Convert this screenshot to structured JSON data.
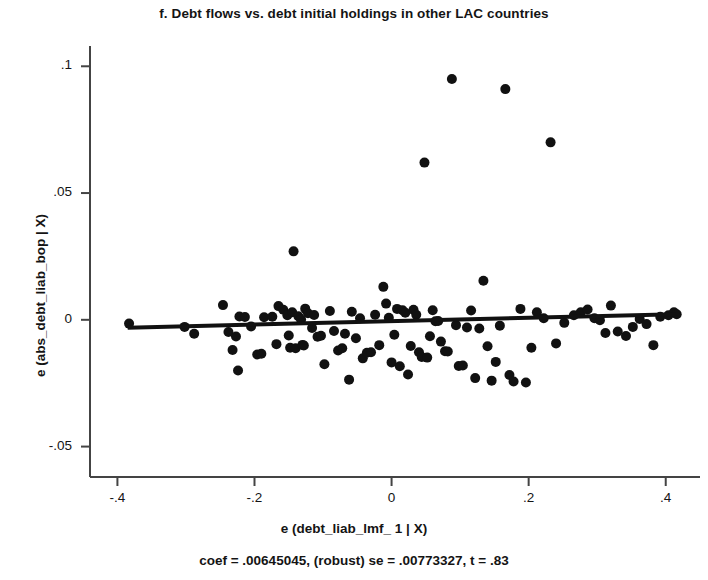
{
  "figure": {
    "title": "f.  Debt flows vs. debt initial holdings in other LAC countries",
    "xlabel": "e (debt_liab_lmf_ 1 | X)",
    "ylabel": "e (abs_debt_liab_bop | X)",
    "caption": "coef = .00645045, (robust) se = .00773327, t = .83",
    "marker_color": "#111111",
    "line_color": "#111111",
    "axis_color": "#444444",
    "background": "#ffffff"
  },
  "axes": {
    "x_ticks": [
      "-.4",
      "-.2",
      "0",
      ".2",
      ".4"
    ],
    "x_tick_values": [
      -0.4,
      -0.2,
      0,
      0.2,
      0.4
    ],
    "y_ticks": [
      ".1",
      ".05",
      "0",
      "-.05"
    ],
    "y_tick_values": [
      0.1,
      0.05,
      0,
      -0.05
    ]
  },
  "chart_data": {
    "type": "scatter",
    "title": "f.  Debt flows vs. debt initial holdings in other LAC countries",
    "xlabel": "e (debt_liab_lmf_ 1 | X)",
    "ylabel": "e (abs_debt_liab_bop | X)",
    "annotation": "coef = .00645045, (robust) se = .00773327, t = .83",
    "xlim": [
      -0.44,
      0.45
    ],
    "ylim": [
      -0.062,
      0.108
    ],
    "xticks": [
      -0.4,
      -0.2,
      0,
      0.2,
      0.4
    ],
    "yticks": [
      -0.05,
      0,
      0.05,
      0.1
    ],
    "grid": false,
    "legend": false,
    "fit_line": {
      "coef": 0.00645045,
      "se": 0.00773327,
      "t": 0.83,
      "x_start": -0.385,
      "y_start": -0.0031,
      "x_end": 0.415,
      "y_end": 0.0022
    },
    "points": [
      {
        "x": -0.383,
        "y": -0.0015
      },
      {
        "x": -0.302,
        "y": -0.0028
      },
      {
        "x": -0.288,
        "y": -0.0055
      },
      {
        "x": -0.246,
        "y": 0.0058
      },
      {
        "x": -0.238,
        "y": -0.0048
      },
      {
        "x": -0.232,
        "y": -0.0119
      },
      {
        "x": -0.227,
        "y": -0.0066
      },
      {
        "x": -0.224,
        "y": -0.02
      },
      {
        "x": -0.222,
        "y": 0.0013
      },
      {
        "x": -0.214,
        "y": 0.0011
      },
      {
        "x": -0.205,
        "y": -0.0026
      },
      {
        "x": -0.196,
        "y": -0.0137
      },
      {
        "x": -0.19,
        "y": -0.0134
      },
      {
        "x": -0.186,
        "y": 0.001
      },
      {
        "x": -0.174,
        "y": 0.0012
      },
      {
        "x": -0.168,
        "y": -0.0096
      },
      {
        "x": -0.165,
        "y": 0.0054
      },
      {
        "x": -0.158,
        "y": 0.004
      },
      {
        "x": -0.152,
        "y": 0.0018
      },
      {
        "x": -0.15,
        "y": -0.0062
      },
      {
        "x": -0.148,
        "y": -0.011
      },
      {
        "x": -0.145,
        "y": 0.003
      },
      {
        "x": -0.143,
        "y": 0.027
      },
      {
        "x": -0.14,
        "y": -0.0112
      },
      {
        "x": -0.136,
        "y": 0.0014
      },
      {
        "x": -0.132,
        "y": 0.0001
      },
      {
        "x": -0.13,
        "y": -0.0099
      },
      {
        "x": -0.128,
        "y": -0.0101
      },
      {
        "x": -0.126,
        "y": 0.0044
      },
      {
        "x": -0.122,
        "y": 0.0026
      },
      {
        "x": -0.116,
        "y": -0.0032
      },
      {
        "x": -0.113,
        "y": 0.0019
      },
      {
        "x": -0.108,
        "y": -0.0067
      },
      {
        "x": -0.103,
        "y": -0.0063
      },
      {
        "x": -0.098,
        "y": -0.0175
      },
      {
        "x": -0.09,
        "y": 0.0035
      },
      {
        "x": -0.084,
        "y": -0.0044
      },
      {
        "x": -0.078,
        "y": -0.0121
      },
      {
        "x": -0.072,
        "y": -0.0112
      },
      {
        "x": -0.068,
        "y": -0.0055
      },
      {
        "x": -0.062,
        "y": -0.0236
      },
      {
        "x": -0.058,
        "y": 0.0032
      },
      {
        "x": -0.052,
        "y": -0.0073
      },
      {
        "x": -0.046,
        "y": 0.0006
      },
      {
        "x": -0.042,
        "y": -0.0152
      },
      {
        "x": -0.036,
        "y": -0.013
      },
      {
        "x": -0.03,
        "y": -0.0128
      },
      {
        "x": -0.024,
        "y": 0.002
      },
      {
        "x": -0.018,
        "y": -0.01
      },
      {
        "x": -0.012,
        "y": 0.013
      },
      {
        "x": -0.008,
        "y": 0.0064
      },
      {
        "x": -0.004,
        "y": 0.0008
      },
      {
        "x": 0.0,
        "y": -0.0168
      },
      {
        "x": 0.004,
        "y": -0.0059
      },
      {
        "x": 0.008,
        "y": 0.0043
      },
      {
        "x": 0.012,
        "y": -0.0183
      },
      {
        "x": 0.016,
        "y": 0.0038
      },
      {
        "x": 0.02,
        "y": 0.0028
      },
      {
        "x": 0.024,
        "y": -0.0216
      },
      {
        "x": 0.028,
        "y": -0.0103
      },
      {
        "x": 0.032,
        "y": 0.004
      },
      {
        "x": 0.036,
        "y": 0.002
      },
      {
        "x": 0.04,
        "y": -0.0128
      },
      {
        "x": 0.044,
        "y": -0.0147
      },
      {
        "x": 0.048,
        "y": 0.062
      },
      {
        "x": 0.052,
        "y": -0.0149
      },
      {
        "x": 0.056,
        "y": -0.0065
      },
      {
        "x": 0.06,
        "y": 0.0038
      },
      {
        "x": 0.064,
        "y": -0.0006
      },
      {
        "x": 0.068,
        "y": -0.0005
      },
      {
        "x": 0.072,
        "y": -0.0086
      },
      {
        "x": 0.078,
        "y": -0.0124
      },
      {
        "x": 0.082,
        "y": -0.0125
      },
      {
        "x": 0.088,
        "y": 0.095
      },
      {
        "x": 0.094,
        "y": -0.0021
      },
      {
        "x": 0.098,
        "y": -0.0182
      },
      {
        "x": 0.104,
        "y": -0.018
      },
      {
        "x": 0.11,
        "y": -0.003
      },
      {
        "x": 0.116,
        "y": 0.0037
      },
      {
        "x": 0.122,
        "y": -0.023
      },
      {
        "x": 0.128,
        "y": -0.0034
      },
      {
        "x": 0.134,
        "y": 0.0154
      },
      {
        "x": 0.14,
        "y": -0.0104
      },
      {
        "x": 0.146,
        "y": -0.024
      },
      {
        "x": 0.152,
        "y": -0.0166
      },
      {
        "x": 0.158,
        "y": -0.0023
      },
      {
        "x": 0.166,
        "y": 0.091
      },
      {
        "x": 0.172,
        "y": -0.0218
      },
      {
        "x": 0.178,
        "y": -0.0243
      },
      {
        "x": 0.188,
        "y": 0.0043
      },
      {
        "x": 0.196,
        "y": -0.0247
      },
      {
        "x": 0.204,
        "y": -0.011
      },
      {
        "x": 0.212,
        "y": 0.003
      },
      {
        "x": 0.222,
        "y": 0.0006
      },
      {
        "x": 0.232,
        "y": 0.07
      },
      {
        "x": 0.24,
        "y": -0.0093
      },
      {
        "x": 0.252,
        "y": -0.0012
      },
      {
        "x": 0.266,
        "y": 0.0018
      },
      {
        "x": 0.276,
        "y": 0.003
      },
      {
        "x": 0.286,
        "y": 0.0041
      },
      {
        "x": 0.296,
        "y": 0.0006
      },
      {
        "x": 0.304,
        "y": -0.0002
      },
      {
        "x": 0.312,
        "y": -0.0052
      },
      {
        "x": 0.32,
        "y": 0.0056
      },
      {
        "x": 0.33,
        "y": -0.0046
      },
      {
        "x": 0.342,
        "y": -0.0064
      },
      {
        "x": 0.352,
        "y": -0.0028
      },
      {
        "x": 0.362,
        "y": 0.0003
      },
      {
        "x": 0.372,
        "y": -0.0017
      },
      {
        "x": 0.382,
        "y": -0.01
      },
      {
        "x": 0.392,
        "y": 0.0012
      },
      {
        "x": 0.404,
        "y": 0.0018
      },
      {
        "x": 0.412,
        "y": 0.003
      },
      {
        "x": 0.416,
        "y": 0.0022
      }
    ]
  }
}
